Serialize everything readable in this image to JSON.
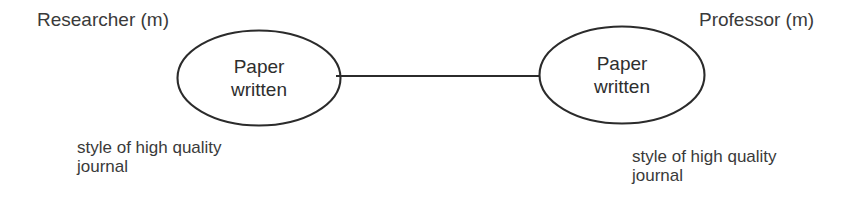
{
  "diagram": {
    "type": "entity-relationship-role-diagram",
    "background_color": "#ffffff",
    "stroke_color": "#2b2b2b",
    "text_color": "#3a3a3a",
    "entities": [
      {
        "id": "researcher",
        "header": "Researcher (m)",
        "role_label": "Paper\nwritten",
        "role_label_line1": "Paper",
        "role_label_line2": "written",
        "caption": "style of high quality\njournal",
        "caption_line1": "style of high quality",
        "caption_line2": "journal"
      },
      {
        "id": "professor",
        "header": "Professor (m)",
        "role_label": "Paper\nwritten",
        "role_label_line1": "Paper",
        "role_label_line2": "written",
        "caption": "style of high quality\njournal",
        "caption_line1": "style of high quality",
        "caption_line2": "journal"
      }
    ],
    "connector": {
      "kind": "straight-line",
      "from": "researcher",
      "to": "professor",
      "label": ""
    }
  }
}
